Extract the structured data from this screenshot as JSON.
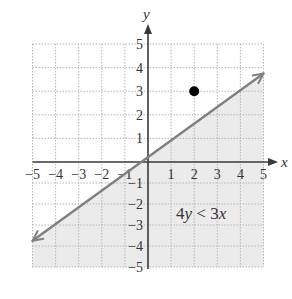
{
  "chart_data": {
    "type": "line",
    "title": "",
    "xlabel": "x",
    "ylabel": "y",
    "xlim": [
      -5,
      5
    ],
    "ylim": [
      -5,
      5
    ],
    "grid": true,
    "x_ticks": [
      -5,
      -4,
      -3,
      -2,
      -1,
      1,
      2,
      3,
      4,
      5
    ],
    "y_ticks": [
      -5,
      -4,
      -3,
      -2,
      -1,
      1,
      2,
      3,
      4,
      5
    ],
    "x_tick_labels": [
      "−5",
      "−4",
      "−3",
      "−2",
      "−1",
      "1",
      "2",
      "3",
      "4",
      "5"
    ],
    "y_tick_labels": [
      "−5",
      "−4",
      "−3",
      "−2",
      "−1",
      "1",
      "2",
      "3",
      "4",
      "5"
    ],
    "series": [
      {
        "name": "boundary line 4y = 3x",
        "kind": "line",
        "style": "solid-with-arrows",
        "x": [
          -5,
          5
        ],
        "y": [
          -3.75,
          3.75
        ]
      },
      {
        "name": "test point",
        "kind": "scatter",
        "x": [
          2
        ],
        "y": [
          3
        ]
      }
    ],
    "shaded_region": {
      "inequality": "4y < 3x",
      "description": "region below the line y = 3x/4"
    },
    "annotations": [
      {
        "text": "4y < 3x",
        "x": 2.1,
        "y": -2.2
      }
    ],
    "colors": {
      "line": "#808080",
      "shade": "#ebebeb",
      "grid": "#b5b5b5",
      "axis": "#3a3a3a",
      "point": "#000000"
    }
  },
  "labels": {
    "x_axis": "x",
    "y_axis": "y",
    "inequality_num": "4",
    "inequality_var1": "y",
    "inequality_op": " < 3",
    "inequality_var2": "x"
  }
}
